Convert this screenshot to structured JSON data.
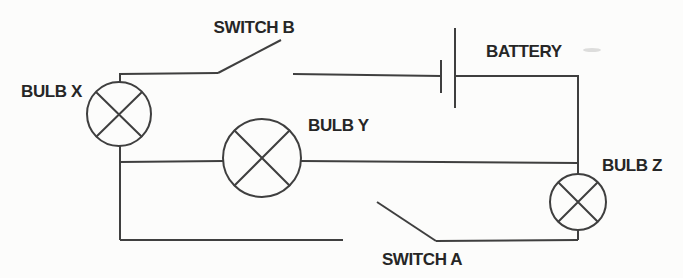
{
  "diagram": {
    "type": "circuit-schematic",
    "background_color": "#fcfcfb",
    "line_color": "#3f3f3f",
    "text_color": "#262626",
    "labels": {
      "switch_b": "SWITCH B",
      "battery": "BATTERY",
      "bulb_x": "BULB X",
      "bulb_y": "BULB Y",
      "bulb_z": "BULB Z",
      "switch_a": "SWITCH A"
    },
    "components": [
      {
        "id": "bulb-x",
        "type": "lamp",
        "label": "BULB X"
      },
      {
        "id": "bulb-y",
        "type": "lamp",
        "label": "BULB Y"
      },
      {
        "id": "bulb-z",
        "type": "lamp",
        "label": "BULB Z"
      },
      {
        "id": "switch-a",
        "type": "switch",
        "label": "SWITCH A",
        "state": "open"
      },
      {
        "id": "switch-b",
        "type": "switch",
        "label": "SWITCH B",
        "state": "open"
      },
      {
        "id": "battery",
        "type": "battery",
        "label": "BATTERY"
      }
    ]
  }
}
